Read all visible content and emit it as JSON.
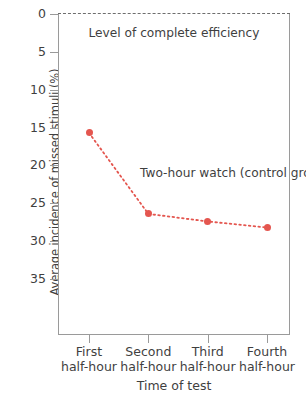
{
  "chart_data": {
    "type": "line",
    "title": "",
    "xlabel": "Time of test",
    "ylabel": "Average incidence of missed stimuli (%)",
    "categories": [
      "First half-hour",
      "Second half-hour",
      "Third half-hour",
      "Fourth half-hour"
    ],
    "x": [
      1,
      2,
      3,
      4
    ],
    "values": [
      15.7,
      26.4,
      27.4,
      28.2
    ],
    "series": [
      {
        "name": "Two-hour watch (control group)",
        "values": [
          15.7,
          26.4,
          27.4,
          28.2
        ],
        "color": "#e4564f",
        "linestyle": "dotted",
        "marker": "circle"
      }
    ],
    "ylim": [
      0,
      38
    ],
    "yticks": [
      0,
      5,
      10,
      15,
      20,
      25,
      30,
      35
    ],
    "ytick_labels": [
      "0",
      "5",
      "10",
      "15",
      "20",
      "25",
      "30",
      "35"
    ],
    "y_inverted": true,
    "grid": false,
    "legend": "none",
    "annotations": [
      {
        "name": "efficiency-reference",
        "text": "Level of complete efficiency",
        "value": 0,
        "linestyle": "dashed",
        "color": "#6d6d6d"
      },
      {
        "name": "series-label",
        "line1": "Two-hour watch",
        "line2": "(control group)"
      }
    ]
  },
  "axes": {
    "y_title": "Average incidence of missed stimuli (%)",
    "x_title": "Time of test",
    "y_tick_labels": [
      "0",
      "5",
      "10",
      "15",
      "20",
      "25",
      "30",
      "35"
    ],
    "x_tick_labels": [
      {
        "line1": "First",
        "line2": "half-hour"
      },
      {
        "line1": "Second",
        "line2": "half-hour"
      },
      {
        "line1": "Third",
        "line2": "half-hour"
      },
      {
        "line1": "Fourth",
        "line2": "half-hour"
      }
    ]
  },
  "annotations": {
    "efficiency": "Level of complete efficiency",
    "series_line1": "Two-hour watch",
    "series_line2": "(control group)"
  },
  "colors": {
    "series": "#e4564f",
    "axis": "#9a9a9a",
    "text": "#3f3f3f",
    "reference_line": "#6d6d6d",
    "background": "#ffffff"
  }
}
